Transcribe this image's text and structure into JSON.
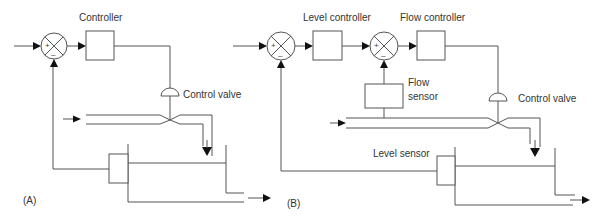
{
  "panel_a": {
    "tag": "(A)",
    "labels": {
      "controller": "Controller",
      "control_valve": "Control valve"
    },
    "summing_junction": {
      "plus": "+",
      "minus": "–"
    }
  },
  "panel_b": {
    "tag": "(B)",
    "labels": {
      "level_controller": "Level controller",
      "flow_controller": "Flow controller",
      "flow_sensor_line1": "Flow",
      "flow_sensor_line2": "sensor",
      "control_valve": "Control valve",
      "level_sensor": "Level sensor"
    },
    "summing_junction_1": {
      "plus": "+",
      "minus": "–"
    },
    "summing_junction_2": {
      "plus": "+",
      "minus": "–"
    }
  },
  "colors": {
    "line": "#555555",
    "arrow": "#111111",
    "text": "#333333"
  }
}
